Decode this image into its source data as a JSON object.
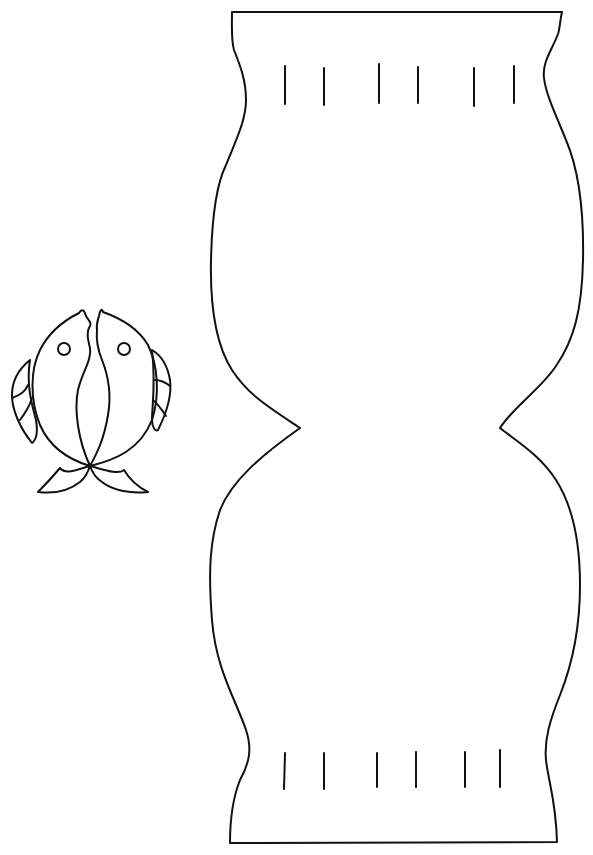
{
  "image": {
    "description": "Black line-art craft template on white background",
    "background": "#ffffff",
    "line_color": "#111111"
  },
  "template": {
    "vase": {
      "label": "Paper fishbowl / vase cutout",
      "top_slits": 6,
      "bottom_slits": 6
    },
    "fish": {
      "label": "Pair of fish cutout",
      "count": 2
    }
  }
}
